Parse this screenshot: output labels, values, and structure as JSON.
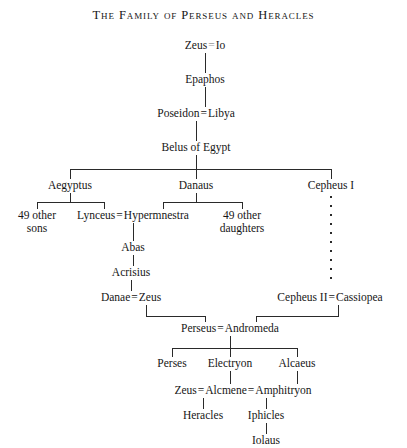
{
  "title": "The Family of Perseus and Heracles",
  "diagram": {
    "type": "genealogy-tree",
    "marriage_symbol": "=",
    "skip_generations_symbol": "dotted-vertical-line",
    "nodes": {
      "zeus_io": {
        "left": "Zeus",
        "symbol": "=",
        "right": "Io"
      },
      "epaphos": {
        "label": "Epaphos"
      },
      "poseidon_libya": {
        "left": "Poseidon",
        "symbol": "=",
        "right": "Libya"
      },
      "belus": {
        "label": "Belus of Egypt"
      },
      "aegyptus": {
        "label": "Aegyptus"
      },
      "danaus": {
        "label": "Danaus"
      },
      "cepheus_i": {
        "label": "Cepheus I"
      },
      "sons_49": {
        "line1": "49 other",
        "line2": "sons"
      },
      "lynceus_hypermnestra": {
        "left": "Lynceus",
        "symbol": "=",
        "right": "Hypermnestra"
      },
      "daughters_49": {
        "line1": "49 other",
        "line2": "daughters"
      },
      "abas": {
        "label": "Abas"
      },
      "acrisius": {
        "label": "Acrisius"
      },
      "danae_zeus": {
        "left": "Danae",
        "symbol": "=",
        "right": "Zeus"
      },
      "cepheus_ii_cassiopea": {
        "left": "Cepheus II",
        "symbol": "=",
        "right": "Cassiopea"
      },
      "perseus_andromeda": {
        "left": "Perseus",
        "symbol": "=",
        "right": "Andromeda"
      },
      "perses": {
        "label": "Perses"
      },
      "electryon": {
        "label": "Electryon"
      },
      "alcaeus": {
        "label": "Alcaeus"
      },
      "zeus_alcmene_amphitryon": {
        "left": "Zeus",
        "symbol1": "=",
        "middle": "Alcmene",
        "symbol2": "=",
        "right": "Amphitryon"
      },
      "heracles": {
        "label": "Heracles"
      },
      "iphicles": {
        "label": "Iphicles"
      },
      "iolaus": {
        "label": "Iolaus"
      }
    }
  }
}
